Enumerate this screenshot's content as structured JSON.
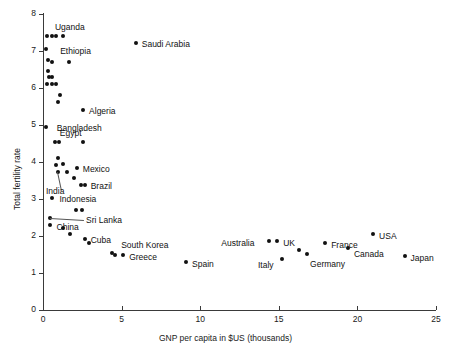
{
  "chart_data": {
    "type": "scatter",
    "title": "",
    "xlabel": "GNP per capita in $US (thousands)",
    "ylabel": "Total fertility rate",
    "xlim": [
      0,
      25
    ],
    "ylim": [
      0,
      8
    ],
    "xticks": [
      0,
      5,
      10,
      15,
      20,
      25
    ],
    "yticks": [
      0,
      1,
      2,
      3,
      4,
      5,
      6,
      7,
      8
    ],
    "grid": false,
    "legend": null,
    "marker": "filled-circle",
    "points": [
      {
        "label": "Uganda",
        "x": 0.25,
        "y": 7.4,
        "labeled": true,
        "label_dx": 8,
        "label_dy": -14
      },
      {
        "label": "",
        "x": 0.55,
        "y": 7.4,
        "labeled": false
      },
      {
        "label": "",
        "x": 0.85,
        "y": 7.4,
        "labeled": false
      },
      {
        "label": "",
        "x": 1.25,
        "y": 7.4,
        "labeled": false
      },
      {
        "label": "Saudi Arabia",
        "x": 5.9,
        "y": 7.2,
        "labeled": true,
        "label_dx": 6,
        "label_dy": -4
      },
      {
        "label": "Ethiopia",
        "x": 0.2,
        "y": 7.05,
        "labeled": true,
        "label_dx": 14,
        "label_dy": -3
      },
      {
        "label": "",
        "x": 0.3,
        "y": 6.75,
        "labeled": false
      },
      {
        "label": "",
        "x": 0.55,
        "y": 6.7,
        "labeled": false
      },
      {
        "label": "",
        "x": 1.65,
        "y": 6.7,
        "labeled": false
      },
      {
        "label": "",
        "x": 0.3,
        "y": 6.45,
        "labeled": false
      },
      {
        "label": "",
        "x": 0.35,
        "y": 6.3,
        "labeled": false
      },
      {
        "label": "",
        "x": 0.55,
        "y": 6.3,
        "labeled": false
      },
      {
        "label": "",
        "x": 0.25,
        "y": 6.1,
        "labeled": false
      },
      {
        "label": "",
        "x": 0.6,
        "y": 6.1,
        "labeled": false
      },
      {
        "label": "",
        "x": 0.8,
        "y": 6.1,
        "labeled": false
      },
      {
        "label": "",
        "x": 1.1,
        "y": 5.8,
        "labeled": false
      },
      {
        "label": "",
        "x": 0.95,
        "y": 5.6,
        "labeled": false
      },
      {
        "label": "Algeria",
        "x": 2.55,
        "y": 5.4,
        "labeled": true,
        "label_dx": 6,
        "label_dy": -4
      },
      {
        "label": "Bangladesh",
        "x": 0.18,
        "y": 4.95,
        "labeled": true,
        "label_dx": 11,
        "label_dy": -4
      },
      {
        "label": "Egypt",
        "x": 0.75,
        "y": 4.52,
        "labeled": true,
        "label_dx": 5,
        "label_dy": -14
      },
      {
        "label": "",
        "x": 1.0,
        "y": 4.52,
        "labeled": false
      },
      {
        "label": "",
        "x": 2.55,
        "y": 4.52,
        "labeled": false
      },
      {
        "label": "",
        "x": 0.95,
        "y": 4.1,
        "labeled": false
      },
      {
        "label": "",
        "x": 0.8,
        "y": 3.92,
        "labeled": false
      },
      {
        "label": "",
        "x": 1.25,
        "y": 3.95,
        "labeled": false
      },
      {
        "label": "Mexico",
        "x": 2.15,
        "y": 3.82,
        "labeled": true,
        "label_dx": 6,
        "label_dy": -4
      },
      {
        "label": "",
        "x": 1.55,
        "y": 3.72,
        "labeled": false
      },
      {
        "label": "India",
        "x": 0.95,
        "y": 3.72,
        "labeled": true,
        "label_dx": -12,
        "label_dy": 14,
        "leader": true
      },
      {
        "label": "",
        "x": 1.95,
        "y": 3.55,
        "labeled": false
      },
      {
        "label": "Brazil",
        "x": 2.65,
        "y": 3.38,
        "labeled": true,
        "label_dx": 6,
        "label_dy": -4
      },
      {
        "label": "",
        "x": 2.4,
        "y": 3.38,
        "labeled": false
      },
      {
        "label": "Indonesia",
        "x": 0.6,
        "y": 3.02,
        "labeled": true,
        "label_dx": 7,
        "label_dy": -4
      },
      {
        "label": "",
        "x": 2.1,
        "y": 2.7,
        "labeled": false
      },
      {
        "label": "",
        "x": 2.45,
        "y": 2.7,
        "labeled": false
      },
      {
        "label": "Sri Lanka",
        "x": 0.45,
        "y": 2.48,
        "labeled": true,
        "label_dx": 36,
        "label_dy": -3,
        "leader": true
      },
      {
        "label": "China",
        "x": 0.42,
        "y": 2.3,
        "labeled": true,
        "label_dx": 7,
        "label_dy": -3
      },
      {
        "label": "",
        "x": 1.25,
        "y": 2.2,
        "labeled": false
      },
      {
        "label": "",
        "x": 1.7,
        "y": 2.05,
        "labeled": false
      },
      {
        "label": "Cuba",
        "x": 2.65,
        "y": 1.92,
        "labeled": true,
        "label_dx": 6,
        "label_dy": -4
      },
      {
        "label": "",
        "x": 2.95,
        "y": 1.8,
        "labeled": false
      },
      {
        "label": "South Korea",
        "x": 4.4,
        "y": 1.55,
        "labeled": true,
        "label_dx": 9,
        "label_dy": -13
      },
      {
        "label": "Greece",
        "x": 5.1,
        "y": 1.48,
        "labeled": true,
        "label_dx": 6,
        "label_dy": -3
      },
      {
        "label": "",
        "x": 4.55,
        "y": 1.48,
        "labeled": false
      },
      {
        "label": "Spain",
        "x": 9.1,
        "y": 1.3,
        "labeled": true,
        "label_dx": 6,
        "label_dy": -3
      },
      {
        "label": "Australia",
        "x": 14.4,
        "y": 1.85,
        "labeled": true,
        "label_dx": -48,
        "label_dy": -3
      },
      {
        "label": "UK",
        "x": 14.9,
        "y": 1.85,
        "labeled": true,
        "label_dx": 6,
        "label_dy": -3
      },
      {
        "label": "Italy",
        "x": 15.2,
        "y": 1.38,
        "labeled": true,
        "label_dx": -24,
        "label_dy": 1
      },
      {
        "label": "",
        "x": 16.3,
        "y": 1.62,
        "labeled": false
      },
      {
        "label": "Germany",
        "x": 16.8,
        "y": 1.52,
        "labeled": true,
        "label_dx": 3,
        "label_dy": 5
      },
      {
        "label": "France",
        "x": 17.95,
        "y": 1.8,
        "labeled": true,
        "label_dx": 6,
        "label_dy": -3
      },
      {
        "label": "Canada",
        "x": 19.4,
        "y": 1.67,
        "labeled": true,
        "label_dx": 6,
        "label_dy": 1
      },
      {
        "label": "USA",
        "x": 21.0,
        "y": 2.05,
        "labeled": true,
        "label_dx": 6,
        "label_dy": -3
      },
      {
        "label": "Japan",
        "x": 23.0,
        "y": 1.45,
        "labeled": true,
        "label_dx": 6,
        "label_dy": -3
      }
    ]
  }
}
